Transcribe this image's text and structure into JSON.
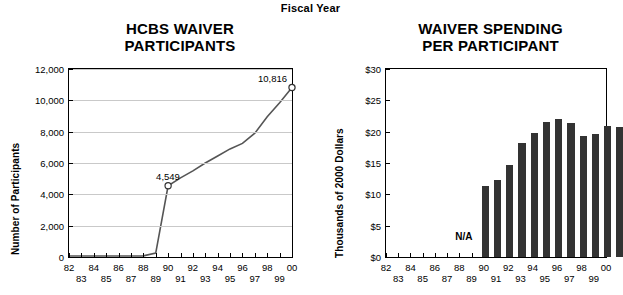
{
  "header": {
    "fiscal_year_label": "Fiscal Year"
  },
  "left_panel": {
    "title_line1": "HCBS WAIVER",
    "title_line2": "PARTICIPANTS",
    "ylabel": "Number of Participants",
    "annotations": [
      {
        "text": "4,549",
        "year": 90
      },
      {
        "text": "10,816",
        "year": 100
      }
    ]
  },
  "right_panel": {
    "title_line1": "WAIVER SPENDING",
    "title_line2": "PER PARTICIPANT",
    "ylabel": "Thousands of 2000 Dollars",
    "na_label": "N/A"
  },
  "chart_data": [
    {
      "type": "line",
      "title": "HCBS WAIVER PARTICIPANTS",
      "xlabel": "Fiscal Year",
      "ylabel": "Number of Participants",
      "ylim": [
        0,
        12000
      ],
      "yticks": [
        0,
        2000,
        4000,
        6000,
        8000,
        10000,
        12000
      ],
      "ytick_labels": [
        "0",
        "2,000",
        "4,000",
        "6,000",
        "8,000",
        "10,000",
        "12,000"
      ],
      "xlim": [
        82,
        100
      ],
      "xticks": [
        82,
        83,
        84,
        85,
        86,
        87,
        88,
        89,
        90,
        91,
        92,
        93,
        94,
        95,
        96,
        97,
        98,
        99,
        100
      ],
      "xtick_labels": [
        "82",
        "83",
        "84",
        "85",
        "86",
        "87",
        "88",
        "89",
        "90",
        "91",
        "92",
        "93",
        "94",
        "95",
        "96",
        "97",
        "98",
        "99",
        "00"
      ],
      "grid": true,
      "markers_at": [
        90,
        100
      ],
      "x": [
        82,
        83,
        84,
        85,
        86,
        87,
        88,
        89,
        90,
        91,
        92,
        93,
        94,
        95,
        96,
        97,
        98,
        99,
        100
      ],
      "values": [
        60,
        60,
        60,
        60,
        60,
        60,
        70,
        250,
        4549,
        5050,
        5500,
        6000,
        6450,
        6900,
        7250,
        7900,
        8950,
        9850,
        10816
      ],
      "data_labels": {
        "90": "4,549",
        "100": "10,816"
      }
    },
    {
      "type": "bar",
      "title": "WAIVER SPENDING PER PARTICIPANT",
      "xlabel": "Fiscal Year",
      "ylabel": "Thousands of 2000 Dollars",
      "ylim": [
        0,
        30
      ],
      "yticks": [
        0,
        5,
        10,
        15,
        20,
        25,
        30
      ],
      "ytick_labels": [
        "$0",
        "$5",
        "$10",
        "$15",
        "$20",
        "$25",
        "$30"
      ],
      "xlim": [
        82,
        100
      ],
      "xticks": [
        82,
        83,
        84,
        85,
        86,
        87,
        88,
        89,
        90,
        91,
        92,
        93,
        94,
        95,
        96,
        97,
        98,
        99,
        100
      ],
      "xtick_labels": [
        "82",
        "83",
        "84",
        "85",
        "86",
        "87",
        "88",
        "89",
        "90",
        "91",
        "92",
        "93",
        "94",
        "95",
        "96",
        "97",
        "98",
        "99",
        "00"
      ],
      "grid": false,
      "categories": [
        82,
        83,
        84,
        85,
        86,
        87,
        88,
        89,
        90,
        91,
        92,
        93,
        94,
        95,
        96,
        97,
        98,
        99,
        100
      ],
      "values": [
        null,
        null,
        null,
        null,
        null,
        null,
        null,
        null,
        11.4,
        12.3,
        14.7,
        18.2,
        19.8,
        21.6,
        22.1,
        21.4,
        19.3,
        19.6,
        20.9,
        20.7
      ],
      "missing_note": "N/A"
    }
  ],
  "colors": {
    "bar": "#333333",
    "line": "#555555",
    "grid": "#c9c9c9",
    "axis": "#000000"
  }
}
